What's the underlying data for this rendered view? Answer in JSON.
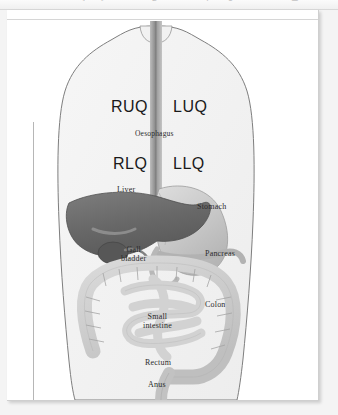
{
  "window": {
    "toolbar_icons": [
      {
        "name": "back-icon",
        "glyph": "◂"
      },
      {
        "name": "forward-icon",
        "glyph": "▸"
      },
      {
        "name": "bold-icon",
        "glyph": "B"
      },
      {
        "name": "italic-icon",
        "glyph": "I"
      },
      {
        "name": "underline-icon",
        "glyph": "U"
      },
      {
        "name": "align-icon",
        "glyph": "≡"
      },
      {
        "name": "list-icon",
        "glyph": "☰"
      }
    ]
  },
  "document": {
    "figure": {
      "title_alt": "Abdominal quadrants and digestive organs",
      "quadrants": [
        {
          "id": "ruq",
          "label": "RUQ"
        },
        {
          "id": "luq",
          "label": "LUQ"
        },
        {
          "id": "rlq",
          "label": "RLQ"
        },
        {
          "id": "llq",
          "label": "LLQ"
        }
      ],
      "organs": [
        {
          "id": "oesophagus",
          "label": "Oesophagus"
        },
        {
          "id": "liver",
          "label": "Liver"
        },
        {
          "id": "stomach",
          "label": "Stomach"
        },
        {
          "id": "gall-bladder",
          "label_line1": "Gall",
          "label_line2": "bladder"
        },
        {
          "id": "pancreas",
          "label": "Pancreas"
        },
        {
          "id": "small-intestine",
          "label_line1": "Small",
          "label_line2": "intestine"
        },
        {
          "id": "colon",
          "label": "Colon"
        },
        {
          "id": "rectum",
          "label": "Rectum"
        },
        {
          "id": "anus",
          "label": "Anus"
        }
      ],
      "colors": {
        "body_fill": "#f2f2f2",
        "body_outline": "#808080",
        "liver": "#6e6e6e",
        "stomach": "#c9c9c9",
        "intestine": "#cfcfcf",
        "oesophagus": "#a8a8a8",
        "label_text": "#2b2b2b"
      }
    }
  }
}
